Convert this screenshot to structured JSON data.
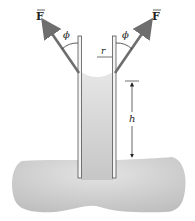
{
  "labels": {
    "force_left": "F",
    "force_right": "F",
    "angle_left": "ϕ",
    "angle_right": "ϕ",
    "radius": "r",
    "height": "h"
  },
  "colors": {
    "liquid": "#c9c9c9",
    "liquid_highlight": "#e2e2e2",
    "force_arrow": "#6e6e6e",
    "tube_wall": "#555555",
    "text": "#222222"
  }
}
